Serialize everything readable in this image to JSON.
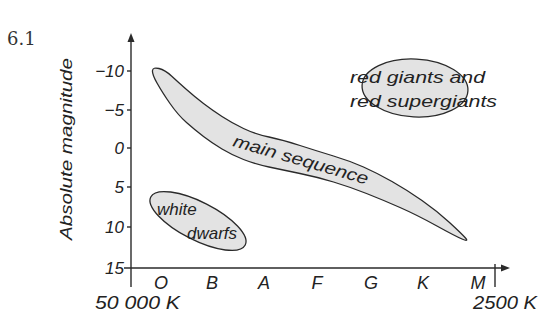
{
  "figure": {
    "number": "6.1",
    "colors": {
      "region_fill": "#e3e3e3",
      "outline": "#2a2a2a",
      "text": "#222222",
      "background": "#ffffff"
    }
  },
  "diagram": {
    "type": "Hertzsprung-Russell diagram (schematic)",
    "y_axis": {
      "label": "Absolute magnitude",
      "ticks": [
        "−10",
        "−5",
        "0",
        "5",
        "10",
        "15"
      ],
      "direction": "brighter upward (negative at top)"
    },
    "x_axis": {
      "spectral_classes": [
        "O",
        "B",
        "A",
        "F",
        "G",
        "K",
        "M"
      ],
      "left_temperature": "50 000 K",
      "right_temperature": "2500 K"
    },
    "regions": {
      "main_sequence": {
        "label": "main sequence"
      },
      "white_dwarfs": {
        "label_line1": "white",
        "label_line2": "dwarfs"
      },
      "giants": {
        "label_line1": "red giants and",
        "label_line2": "red supergiants"
      }
    }
  }
}
